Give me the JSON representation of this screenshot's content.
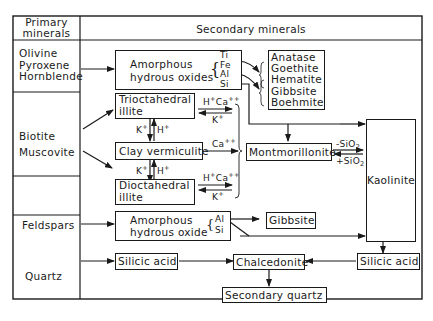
{
  "header": {
    "primary_label_line1": "Primary",
    "primary_label_line2": "minerals",
    "secondary_label": "Secondary minerals"
  },
  "primary_minerals": {
    "row1": [
      "Olivine",
      "Pyroxene",
      "Hornblende"
    ],
    "row2": [
      "Biotite",
      "Muscovite"
    ],
    "row3": [
      "Feldspars"
    ],
    "row4": [
      "Quartz"
    ]
  },
  "secondary": {
    "amorphous_oxides": {
      "line1": "Amorphous",
      "line2": "hydrous oxides",
      "elements": [
        "Ti",
        "Fe",
        "Al",
        "Si"
      ]
    },
    "oxide_products": [
      "Anatase",
      "Goethite",
      "Hematite",
      "Gibbsite",
      "Boehmite"
    ],
    "trioctahedral_illite": {
      "line1": "Trioctahedral",
      "line2": "illite"
    },
    "clay_vermiculite": "Clay vermiculite",
    "dioctahedral_illite": {
      "line1": "Dioctahedral",
      "line2": "illite"
    },
    "montmorillonite": "Montmorillonite",
    "kaolinite": "Kaolinite",
    "amorphous_oxide_feldspar": {
      "line1": "Amorphous",
      "line2": "hydrous oxide",
      "elements": [
        "Al",
        "Si"
      ]
    },
    "gibbsite": "Gibbsite",
    "silicic_acid_left": "Silicic acid",
    "chalcedonite": "Chalcedonite",
    "silicic_acid_right": "Silicic acid",
    "secondary_quartz": "Secondary quartz"
  },
  "reaction_labels": {
    "tri_top": {
      "a": "H",
      "a_sup": "+",
      "b": "Ca",
      "b_sup": "++"
    },
    "tri_bottom": {
      "a": "K",
      "a_sup": "+"
    },
    "tri_verm_left": {
      "a": "K",
      "a_sup": "+"
    },
    "tri_verm_right": {
      "a": "H",
      "a_sup": "+"
    },
    "verm_mont": {
      "a": "Ca",
      "a_sup": "++"
    },
    "verm_di_left": {
      "a": "K",
      "a_sup": "+"
    },
    "verm_di_right": {
      "a": "H",
      "a_sup": "+"
    },
    "di_top": {
      "a": "H",
      "a_sup": "+",
      "b": "Ca",
      "b_sup": "++"
    },
    "di_bottom": {
      "a": "K",
      "a_sup": "+"
    },
    "mont_kaol_top": {
      "a": "-SiO",
      "a_sub": "2"
    },
    "mont_kaol_bottom": {
      "a": "+SiO",
      "a_sub": "2"
    }
  }
}
